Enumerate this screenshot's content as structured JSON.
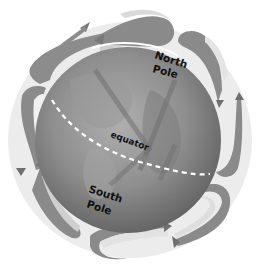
{
  "diagram": {
    "labels": {
      "north_pole_line1": "North",
      "north_pole_line2": "Pole",
      "equator": "equator",
      "south_pole_line1": "South",
      "south_pole_line2": "Pole"
    },
    "colors": {
      "background": "#ffffff",
      "globe_dark": "#6e6e6e",
      "globe_mid": "#8c8c8c",
      "globe_light": "#a8a8a8",
      "arrow": "#8a8a8a",
      "arrow_light": "#e6e6e6",
      "equator_line": "#ffffff",
      "text": "#111111"
    },
    "cells": [
      {
        "name": "north-polar-cell-left",
        "position": "top-left"
      },
      {
        "name": "north-polar-cell-right",
        "position": "top-right"
      },
      {
        "name": "left-mid-cell",
        "position": "left"
      },
      {
        "name": "right-mid-cell",
        "position": "right"
      },
      {
        "name": "south-cell-left",
        "position": "bottom-left"
      },
      {
        "name": "south-cell-right",
        "position": "bottom-right"
      }
    ]
  }
}
